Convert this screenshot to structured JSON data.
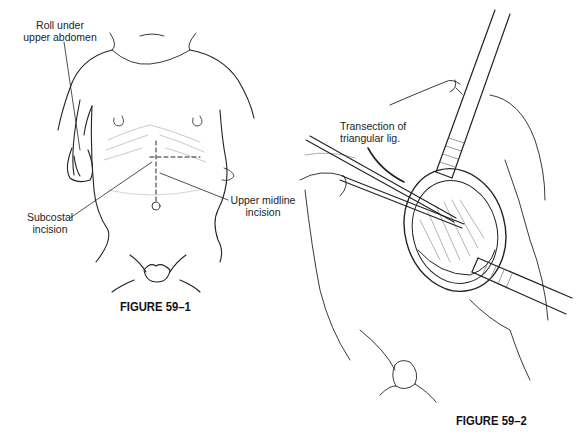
{
  "figure_1": {
    "caption": "FIGURE 59–1",
    "labels": {
      "roll": [
        "Roll under",
        "upper abdomen"
      ],
      "subcostal": [
        "Subcostal",
        "incision"
      ],
      "midline": [
        "Upper midline",
        "incision"
      ]
    }
  },
  "figure_2": {
    "caption": "FIGURE 59–2",
    "labels": {
      "transection": [
        "Transection of",
        "triangular lig."
      ]
    }
  }
}
